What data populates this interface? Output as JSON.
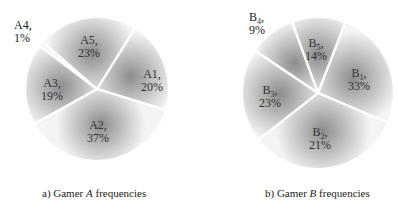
{
  "chart_data": [
    {
      "type": "pie",
      "title": "a) Gamer A frequencies",
      "categories": [
        "A1",
        "A2",
        "A3",
        "A4",
        "A5"
      ],
      "values": [
        20,
        37,
        19,
        1,
        23
      ],
      "unit": "%",
      "labels": [
        "A1,\n20%",
        "A2,\n37%",
        "A3,\n19%",
        "A4,\n1%",
        "A5,\n23%"
      ]
    },
    {
      "type": "pie",
      "title": "b) Gamer B frequencies",
      "categories": [
        "B1",
        "B2",
        "B3",
        "B4",
        "B5"
      ],
      "values": [
        33,
        21,
        23,
        9,
        14
      ],
      "unit": "%",
      "labels": [
        "B1,\n33%",
        "B2,\n21%",
        "B3,\n23%",
        "B4,\n9%",
        "B5,\n14%"
      ]
    }
  ],
  "pieA": {
    "caption_prefix": "a) Gamer ",
    "caption_var": "A",
    "caption_suffix": " frequencies",
    "slices": [
      {
        "name": "A1,",
        "pct": "20%"
      },
      {
        "name": "A2,",
        "pct": "37%"
      },
      {
        "name": "A3,",
        "pct": "19%"
      },
      {
        "name": "A4,",
        "pct": "1%"
      },
      {
        "name": "A5,",
        "pct": "23%"
      }
    ]
  },
  "pieB": {
    "caption_prefix": "b) Gamer ",
    "caption_var": "B",
    "caption_suffix": " frequencies",
    "slices": [
      {
        "name": "B",
        "sub": "1",
        "pct": "33%"
      },
      {
        "name": "B",
        "sub": "2",
        "pct": "21%"
      },
      {
        "name": "B",
        "sub": "3",
        "pct": "23%"
      },
      {
        "name": "B",
        "sub": "4",
        "pct": "9%"
      },
      {
        "name": "B",
        "sub": "5",
        "pct": "14%"
      }
    ]
  },
  "colors": {
    "shade_dark": "#8a8a8a",
    "shade_light": "#f4f4f4",
    "separator": "#ffffff"
  }
}
